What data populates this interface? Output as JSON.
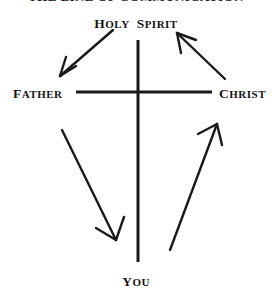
{
  "page": {
    "title": "THE LINE OF COMMUNICATION",
    "background_color": "#ffffff",
    "ink_color": "#1a1a1a",
    "width": 272,
    "height": 295
  },
  "diagram": {
    "name": "line-of-communication-cross",
    "cross": {
      "vertical": {
        "x": 138,
        "y_top": 40,
        "y_bottom": 262,
        "stroke": 3
      },
      "horizontal": {
        "y": 92,
        "x_left": 76,
        "x_right": 212,
        "stroke": 3
      }
    }
  },
  "labels": {
    "holy_spirit": {
      "first": "H",
      "first_rest": "OLY",
      "second": "S",
      "second_rest": "PIRIT",
      "text": "HOLY SPIRIT"
    },
    "father": {
      "first": "F",
      "rest": "ATHER",
      "text": "FATHER"
    },
    "christ": {
      "first": "C",
      "rest": "HRIST",
      "text": "CHRIST"
    },
    "you": {
      "first": "Y",
      "rest": "OU",
      "text": "YOU"
    }
  },
  "arrows": [
    {
      "name": "arrow-holy-spirit-to-father",
      "from": "HOLY SPIRIT",
      "to": "FATHER",
      "direction": "down-left",
      "start": [
        113,
        30
      ],
      "end": [
        58,
        78
      ]
    },
    {
      "name": "arrow-christ-to-holy-spirit",
      "from": "CHRIST",
      "to": "HOLY SPIRIT",
      "direction": "up-left",
      "start": [
        224,
        78
      ],
      "end": [
        176,
        32
      ]
    },
    {
      "name": "arrow-father-to-you",
      "from": "FATHER",
      "to": "YOU",
      "direction": "down-right",
      "start": [
        63,
        131
      ],
      "end": [
        116,
        241
      ]
    },
    {
      "name": "arrow-you-to-christ",
      "from": "YOU",
      "to": "CHRIST",
      "direction": "up-right",
      "start": [
        170,
        250
      ],
      "end": [
        217,
        124
      ]
    }
  ]
}
